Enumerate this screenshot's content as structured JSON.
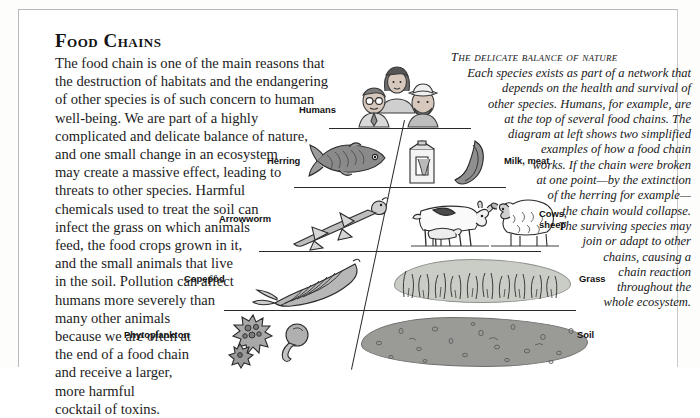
{
  "page": {
    "title": "Food Chains"
  },
  "left_column": {
    "lines": [
      "The food chain is one of the main reasons that",
      "the destruction of habitats and the endangering",
      "of other species is of such concern to human",
      "well-being. We are part of a highly",
      "complicated and delicate balance of nature,",
      "and one small change in an ecosystem",
      "may create a massive effect, leading to",
      "threats to other species. Harmful",
      "chemicals used to treat the soil can",
      "infect the grass on which animals",
      "feed, the food crops grown in it,",
      "and the small animals that live",
      "in the soil. Pollution can affect",
      "humans more severely than",
      "many other animals",
      "because we are often at",
      "the end of a food chain",
      "and receive a larger,",
      "more harmful",
      "cocktail of toxins."
    ]
  },
  "right_column": {
    "heading": "The delicate balance of nature",
    "lines": [
      "Each species exists as part of a network that",
      "depends on the health and survival of",
      "other species. Humans, for example, are",
      "at the top of several food chains. The",
      "diagram at left shows two simplified",
      "examples of how a food chain",
      "works. If the chain were broken",
      "at one point—by the extinction",
      "of the herring for example—",
      "the chain would collapse.",
      "The surviving species may",
      "join or adapt to other",
      "chains, causing a",
      "chain reaction",
      "throughout the",
      "whole ecosystem."
    ]
  },
  "diagram": {
    "name": "food-chain-pyramid",
    "labels_left": [
      {
        "id": "humans",
        "text": "Humans"
      },
      {
        "id": "herring",
        "text": "Herring"
      },
      {
        "id": "arrowworm",
        "text": "Arrowworm"
      },
      {
        "id": "copepod",
        "text": "Copepod"
      },
      {
        "id": "phytoplankton",
        "text": "Phytoplankton"
      }
    ],
    "labels_right": [
      {
        "id": "milk-meat",
        "text": "Milk, meat"
      },
      {
        "id": "cows-sheep",
        "text": "Cows,\nsheep"
      },
      {
        "id": "cows-sheep-line1",
        "text": "Cows,"
      },
      {
        "id": "cows-sheep-line2",
        "text": "sheep"
      },
      {
        "id": "grass",
        "text": "Grass"
      },
      {
        "id": "soil",
        "text": "Soil"
      }
    ],
    "colors": {
      "grass": "#c9cdc6",
      "soil": "#9a9a97",
      "rule": "#2a2a2a",
      "ink": "#111111"
    }
  }
}
